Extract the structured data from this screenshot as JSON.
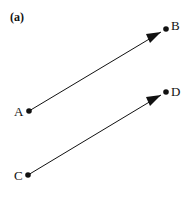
{
  "figure": {
    "panel_label": "(a)",
    "points": {
      "A": {
        "label": "A",
        "x": 29,
        "y": 111
      },
      "B": {
        "label": "B",
        "x": 166,
        "y": 29
      },
      "C": {
        "label": "C",
        "x": 28,
        "y": 175
      },
      "D": {
        "label": "D",
        "x": 166,
        "y": 92
      }
    },
    "vectors": [
      {
        "from": "A",
        "to": "B",
        "name": "vector-AB"
      },
      {
        "from": "C",
        "to": "D",
        "name": "vector-CD"
      }
    ],
    "colors": {
      "stroke": "#111111",
      "background": "#ffffff"
    }
  }
}
